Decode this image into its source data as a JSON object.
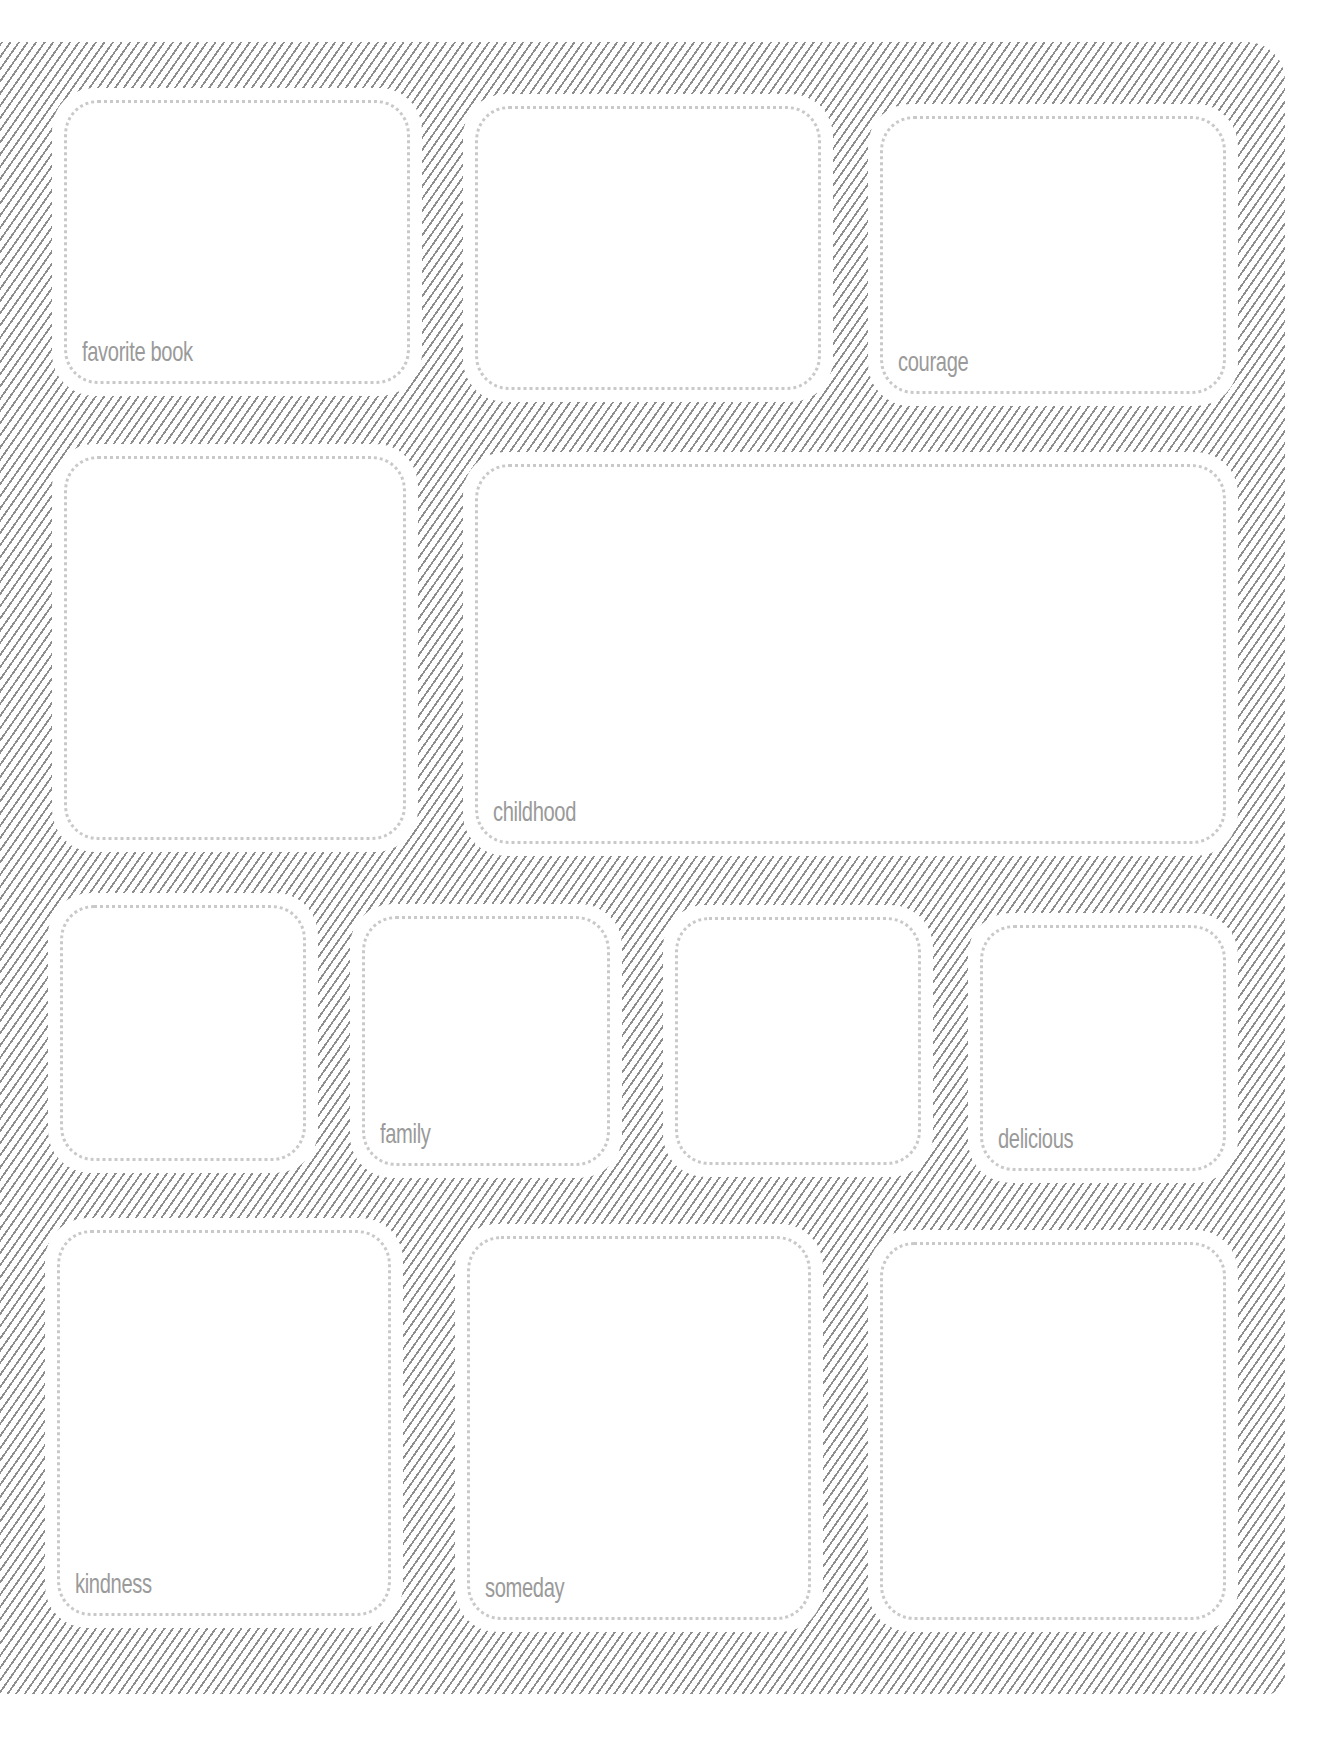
{
  "page": {
    "pattern": "diagonal-hatching",
    "hatch_color": "#8e8e8e",
    "label_color": "#9a9a9a",
    "dot_color": "#c9c9c9"
  },
  "boxes": [
    {
      "id": 1,
      "row": 1,
      "label": "favorite book"
    },
    {
      "id": 2,
      "row": 1,
      "label": ""
    },
    {
      "id": 3,
      "row": 1,
      "label": "courage"
    },
    {
      "id": 4,
      "row": 2,
      "label": ""
    },
    {
      "id": 5,
      "row": 2,
      "label": "childhood"
    },
    {
      "id": 6,
      "row": 3,
      "label": ""
    },
    {
      "id": 7,
      "row": 3,
      "label": "family"
    },
    {
      "id": 8,
      "row": 3,
      "label": ""
    },
    {
      "id": 9,
      "row": 3,
      "label": "delicious"
    },
    {
      "id": 10,
      "row": 4,
      "label": "kindness"
    },
    {
      "id": 11,
      "row": 4,
      "label": "someday"
    },
    {
      "id": 12,
      "row": 4,
      "label": ""
    }
  ]
}
